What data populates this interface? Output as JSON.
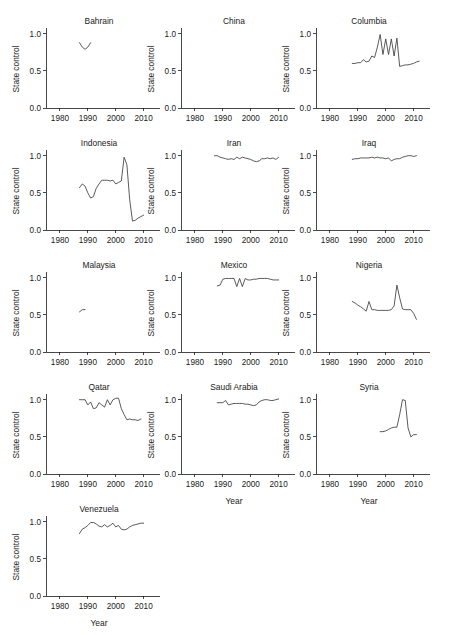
{
  "header": {
    "running_head": ""
  },
  "figure": {
    "grid": {
      "rows": 5,
      "cols": 3
    },
    "y_axis_label": "State control",
    "x_axis_label": "Year",
    "y_ticks": [
      "0.0",
      "0.5",
      "1.0"
    ],
    "x_ticks": [
      "1980",
      "1990",
      "2000",
      "2010"
    ],
    "line_color": "#3d3d3d",
    "axis_color": "#1a1a1a",
    "background": "#ffffff"
  },
  "chart_data": {
    "type": "line",
    "xlabel": "Year",
    "ylabel": "State control",
    "xlim": [
      1975,
      2013
    ],
    "ylim": [
      0.0,
      1.05
    ],
    "xticks": [
      1980,
      1990,
      2000,
      2010
    ],
    "yticks": [
      0.0,
      0.5,
      1.0
    ],
    "grid": false,
    "legend": "none",
    "layout": "small-multiples 5x3",
    "panels": [
      {
        "name": "Bahrain",
        "row": 1,
        "col": 1,
        "x": [
          1987,
          1988,
          1989,
          1990,
          1991
        ],
        "y": [
          0.88,
          0.82,
          0.79,
          0.82,
          0.88
        ]
      },
      {
        "name": "China",
        "row": 1,
        "col": 2,
        "x": [],
        "y": [],
        "note": "no data plotted"
      },
      {
        "name": "Columbia",
        "row": 1,
        "col": 3,
        "x": [
          1988,
          1989,
          1990,
          1991,
          1992,
          1993,
          1994,
          1995,
          1996,
          1997,
          1998,
          1999,
          2000,
          2001,
          2002,
          2003,
          2004,
          2005,
          2006,
          2007,
          2008,
          2009,
          2010,
          2011,
          2012
        ],
        "y": [
          0.6,
          0.6,
          0.61,
          0.61,
          0.65,
          0.62,
          0.63,
          0.7,
          0.68,
          0.82,
          0.99,
          0.72,
          0.93,
          0.72,
          0.93,
          0.7,
          0.94,
          0.56,
          0.57,
          0.58,
          0.58,
          0.59,
          0.6,
          0.62,
          0.63
        ]
      },
      {
        "name": "Indonesia",
        "row": 2,
        "col": 1,
        "x": [
          1987,
          1988,
          1989,
          1990,
          1991,
          1992,
          1993,
          1994,
          1995,
          1996,
          1997,
          1998,
          1999,
          2000,
          2001,
          2002,
          2003,
          2004,
          2005,
          2006,
          2007,
          2008,
          2009,
          2010
        ],
        "y": [
          0.57,
          0.62,
          0.59,
          0.5,
          0.43,
          0.45,
          0.56,
          0.62,
          0.67,
          0.67,
          0.67,
          0.66,
          0.67,
          0.62,
          0.64,
          0.66,
          0.98,
          0.88,
          0.41,
          0.12,
          0.13,
          0.16,
          0.18,
          0.2
        ]
      },
      {
        "name": "Iran",
        "row": 2,
        "col": 2,
        "x": [
          1987,
          1988,
          1989,
          1990,
          1991,
          1992,
          1993,
          1994,
          1995,
          1996,
          1997,
          1998,
          1999,
          2000,
          2001,
          2002,
          2003,
          2004,
          2005,
          2006,
          2007,
          2008,
          2009,
          2010
        ],
        "y": [
          1.0,
          1.0,
          0.98,
          0.97,
          0.96,
          0.95,
          0.96,
          0.95,
          0.98,
          0.96,
          0.98,
          0.97,
          0.96,
          0.95,
          0.93,
          0.92,
          0.93,
          0.96,
          0.96,
          0.97,
          0.96,
          0.97,
          0.95,
          0.98
        ]
      },
      {
        "name": "Iraq",
        "row": 2,
        "col": 3,
        "x": [
          1988,
          1989,
          1990,
          1991,
          1992,
          1993,
          1994,
          1995,
          1996,
          1997,
          1998,
          1999,
          2000,
          2001,
          2002,
          2003,
          2004,
          2005,
          2006,
          2007,
          2008,
          2009,
          2010,
          2011
        ],
        "y": [
          0.95,
          0.96,
          0.96,
          0.97,
          0.97,
          0.97,
          0.97,
          0.98,
          0.97,
          0.98,
          0.97,
          0.97,
          0.96,
          0.97,
          0.93,
          0.95,
          0.96,
          0.96,
          0.98,
          0.99,
          1.0,
          1.0,
          0.99,
          1.0
        ]
      },
      {
        "name": "Malaysia",
        "row": 3,
        "col": 1,
        "x": [
          1987,
          1988,
          1989
        ],
        "y": [
          0.54,
          0.57,
          0.57
        ]
      },
      {
        "name": "Mexico",
        "row": 3,
        "col": 2,
        "x": [
          1988,
          1989,
          1990,
          1991,
          1992,
          1993,
          1994,
          1995,
          1996,
          1997,
          1998,
          1999,
          2000,
          2001,
          2002,
          2003,
          2004,
          2005,
          2006,
          2007,
          2008,
          2009,
          2010
        ],
        "y": [
          0.89,
          0.9,
          0.98,
          0.99,
          0.99,
          0.99,
          0.99,
          0.88,
          0.99,
          0.88,
          0.99,
          0.97,
          0.97,
          0.98,
          0.98,
          0.99,
          0.99,
          0.99,
          0.99,
          0.98,
          0.97,
          0.97,
          0.97
        ]
      },
      {
        "name": "Nigeria",
        "row": 3,
        "col": 3,
        "x": [
          1988,
          1989,
          1990,
          1991,
          1992,
          1993,
          1994,
          1995,
          1996,
          1997,
          1998,
          1999,
          2000,
          2001,
          2002,
          2003,
          2004,
          2005,
          2006,
          2007,
          2008,
          2009,
          2010,
          2011
        ],
        "y": [
          0.68,
          0.66,
          0.63,
          0.61,
          0.58,
          0.55,
          0.68,
          0.57,
          0.57,
          0.56,
          0.56,
          0.56,
          0.56,
          0.56,
          0.57,
          0.62,
          0.9,
          0.73,
          0.58,
          0.57,
          0.57,
          0.57,
          0.52,
          0.44
        ]
      },
      {
        "name": "Qatar",
        "row": 4,
        "col": 1,
        "x": [
          1987,
          1988,
          1989,
          1990,
          1991,
          1992,
          1993,
          1994,
          1995,
          1996,
          1997,
          1998,
          1999,
          2000,
          2001,
          2002,
          2003,
          2004,
          2005,
          2006,
          2007,
          2008,
          2009
        ],
        "y": [
          1.0,
          1.0,
          1.0,
          0.93,
          0.97,
          0.88,
          0.89,
          0.96,
          0.93,
          0.9,
          1.0,
          0.93,
          1.0,
          1.02,
          1.02,
          0.88,
          0.8,
          0.73,
          0.74,
          0.73,
          0.73,
          0.72,
          0.74
        ]
      },
      {
        "name": "Saudi Arabia",
        "row": 4,
        "col": 2,
        "x": [
          1988,
          1989,
          1990,
          1991,
          1992,
          1993,
          1994,
          1995,
          1996,
          1997,
          1998,
          1999,
          2000,
          2001,
          2002,
          2003,
          2004,
          2005,
          2006,
          2007,
          2008,
          2009,
          2010
        ],
        "y": [
          0.96,
          0.96,
          0.96,
          0.99,
          0.93,
          0.94,
          0.95,
          0.95,
          0.95,
          0.95,
          0.94,
          0.94,
          0.93,
          0.92,
          0.93,
          0.97,
          0.99,
          1.0,
          1.0,
          0.99,
          0.99,
          1.0,
          1.01
        ]
      },
      {
        "name": "Syria",
        "row": 4,
        "col": 3,
        "x": [
          1998,
          1999,
          2000,
          2001,
          2002,
          2003,
          2004,
          2005,
          2006,
          2007,
          2008,
          2009,
          2010,
          2011
        ],
        "y": [
          0.57,
          0.57,
          0.58,
          0.6,
          0.62,
          0.63,
          0.63,
          0.8,
          1.0,
          0.99,
          0.62,
          0.5,
          0.53,
          0.53
        ]
      },
      {
        "name": "Venezuela",
        "row": 5,
        "col": 1,
        "x": [
          1987,
          1988,
          1989,
          1990,
          1991,
          1992,
          1993,
          1994,
          1995,
          1996,
          1997,
          1998,
          1999,
          2000,
          2001,
          2002,
          2003,
          2004,
          2005,
          2006,
          2007,
          2008,
          2009,
          2010
        ],
        "y": [
          0.84,
          0.9,
          0.92,
          0.95,
          0.99,
          0.99,
          0.97,
          0.94,
          0.93,
          0.96,
          0.93,
          0.95,
          0.98,
          0.93,
          0.95,
          0.9,
          0.89,
          0.9,
          0.93,
          0.95,
          0.96,
          0.97,
          0.98,
          0.98
        ]
      }
    ]
  }
}
